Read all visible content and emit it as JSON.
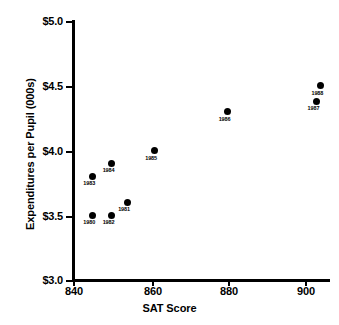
{
  "chart_data": {
    "type": "scatter",
    "title": "",
    "xlabel": "SAT Score",
    "ylabel": "Expenditures per Pupil (000s)",
    "xlim": [
      840,
      910
    ],
    "ylim": [
      3.0,
      5.0
    ],
    "grid": false,
    "legend": "none",
    "x_ticks": [
      "840",
      "860",
      "880",
      "900"
    ],
    "x_tick_values": [
      840,
      860,
      880,
      900
    ],
    "y_ticks": [
      "$3.0",
      "$3.5",
      "$4.0",
      "$4.5",
      "$5.0"
    ],
    "y_tick_values": [
      3.0,
      3.5,
      4.0,
      4.5,
      5.0
    ],
    "points": [
      {
        "label": "1980",
        "x": 845,
        "y": 3.5
      },
      {
        "label": "1981",
        "x": 854,
        "y": 3.6
      },
      {
        "label": "1982",
        "x": 850,
        "y": 3.5
      },
      {
        "label": "1983",
        "x": 845,
        "y": 3.8
      },
      {
        "label": "1984",
        "x": 850,
        "y": 3.9
      },
      {
        "label": "1985",
        "x": 861,
        "y": 4.0
      },
      {
        "label": "1986",
        "x": 880,
        "y": 4.3
      },
      {
        "label": "1987",
        "x": 903,
        "y": 4.38
      },
      {
        "label": "1988",
        "x": 904,
        "y": 4.5
      }
    ]
  },
  "axes": {
    "x_title": "SAT Score",
    "y_title": "Expenditures per Pupil (000s)"
  }
}
